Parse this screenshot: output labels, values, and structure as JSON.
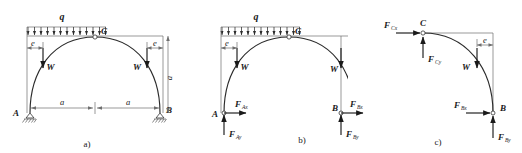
{
  "figure": {
    "panels": [
      {
        "id": "a",
        "caption": "a)",
        "description": "Full three-hinged arch ACB under uniform load q with self weights W",
        "labels": {
          "load": "q",
          "apex": "C",
          "left_support": "A",
          "right_support": "B",
          "weight_left": "W",
          "weight_right": "W",
          "dim_e_left": "e",
          "dim_e_right": "e",
          "dim_a_left": "a",
          "dim_a_right": "a",
          "dim_height": "a"
        }
      },
      {
        "id": "b",
        "caption": "b)",
        "description": "Whole arch free body with support reactions at A and B",
        "labels": {
          "load": "q",
          "apex": "C",
          "left_support": "A",
          "right_support": "B",
          "weight_left": "W",
          "weight_right": "W",
          "dim_e_left": "e",
          "dim_e_right": "e",
          "reaction_ax": "F",
          "reaction_ax_sub": "Ax",
          "reaction_ay": "F",
          "reaction_ay_sub": "Ay",
          "reaction_bx": "F",
          "reaction_bx_sub": "Bx",
          "reaction_by": "F",
          "reaction_by_sub": "By"
        }
      },
      {
        "id": "c",
        "caption": "c)",
        "description": "Right half CB free body with hinge forces at C and reactions at B",
        "labels": {
          "apex": "C",
          "right_support": "B",
          "weight": "W",
          "dim_e": "e",
          "hinge_cx": "F",
          "hinge_cx_sub": "Cx",
          "hinge_cy": "F",
          "hinge_cy_sub": "Cy",
          "reaction_bx": "F",
          "reaction_bx_sub": "Bx",
          "reaction_by": "F",
          "reaction_by_sub": "By"
        }
      }
    ],
    "colors": {
      "stroke_main": "#2b2b2b",
      "stroke_thin": "#6e6e6e",
      "text": "#1a1a1a",
      "background": "#ffffff"
    }
  }
}
